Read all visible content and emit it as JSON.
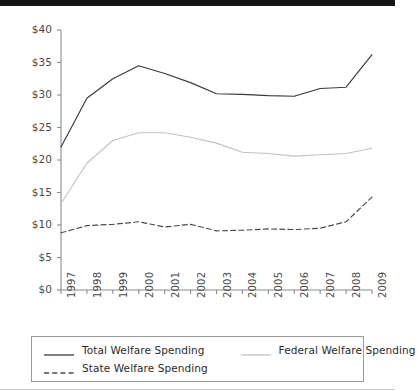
{
  "chart_data": {
    "type": "line",
    "title": "",
    "xlabel": "",
    "ylabel": "",
    "x": [
      "1997",
      "1998",
      "1999",
      "2000",
      "2001",
      "2002",
      "2003",
      "2004",
      "2005",
      "2006",
      "2007",
      "2008",
      "2009"
    ],
    "categories": [
      "1997",
      "1998",
      "1999",
      "2000",
      "2001",
      "2002",
      "2003",
      "2004",
      "2005",
      "2006",
      "2007",
      "2008",
      "2009"
    ],
    "ylim": [
      0,
      40
    ],
    "yticks": [
      0,
      5,
      10,
      15,
      20,
      25,
      30,
      35,
      40
    ],
    "ytick_labels": [
      "$0",
      "$5",
      "$10",
      "$15",
      "$20",
      "$25",
      "$30",
      "$35",
      "$40"
    ],
    "grid": false,
    "legend_position": "bottom",
    "series": [
      {
        "name": "Total Welfare Spending",
        "color": "#3a3a3a",
        "style": "solid",
        "values": [
          22.0,
          29.5,
          32.5,
          34.5,
          33.3,
          31.9,
          30.2,
          30.1,
          29.9,
          29.8,
          31.0,
          31.2,
          36.2
        ]
      },
      {
        "name": "Federal Welfare Spending",
        "color": "#c2c2c2",
        "style": "solid",
        "values": [
          13.3,
          19.5,
          23.0,
          24.2,
          24.2,
          23.5,
          22.6,
          21.2,
          21.0,
          20.6,
          20.8,
          21.0,
          21.8
        ]
      },
      {
        "name": "State Welfare Spending",
        "color": "#4a4a4a",
        "style": "dashed",
        "values": [
          8.8,
          9.9,
          10.1,
          10.5,
          9.7,
          10.1,
          9.1,
          9.2,
          9.4,
          9.3,
          9.5,
          10.5,
          14.3
        ]
      }
    ]
  },
  "legend": {
    "entries": [
      {
        "label": "Total Welfare Spending"
      },
      {
        "label": "Federal Welfare Spending"
      },
      {
        "label": "State Welfare Spending"
      }
    ]
  },
  "axis": {
    "y_label_prefix": "$",
    "axis_color": "#8c8c8c"
  }
}
